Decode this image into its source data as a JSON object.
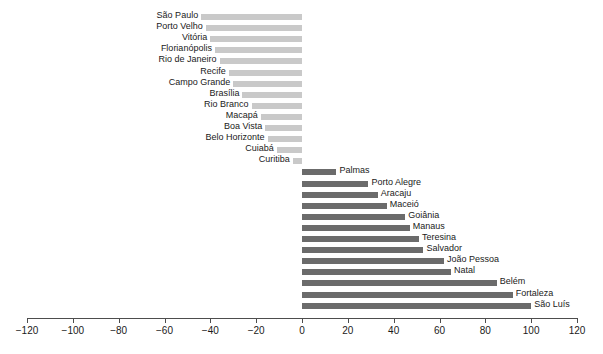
{
  "chart_data": {
    "type": "bar",
    "orientation": "horizontal",
    "title": "",
    "subtitle": "",
    "xlabel": "",
    "ylabel": "",
    "xlim": [
      -120,
      120
    ],
    "xticks": [
      -120,
      -100,
      -80,
      -60,
      -40,
      -20,
      0,
      20,
      40,
      60,
      80,
      100,
      120
    ],
    "xticklabels": [
      "−120",
      "−100",
      "−80",
      "−60",
      "−40",
      "−20",
      "0",
      "20",
      "40",
      "60",
      "80",
      "100",
      "120"
    ],
    "grid": false,
    "legend": null,
    "colors": {
      "negative": "#c9c9c9",
      "positive": "#6b6b6b",
      "axis": "#4d4d4d",
      "text": "#1a1a1a",
      "background": "#ffffff"
    },
    "categories": [
      "São Paulo",
      "Porto Velho",
      "Vitória",
      "Florianópolis",
      "Rio de Janeiro",
      "Recife",
      "Campo Grande",
      "Brasília",
      "Rio Branco",
      "Macapá",
      "Boa Vista",
      "Belo Horizonte",
      "Cuiabá",
      "Curitiba",
      "Palmas",
      "Porto Alegre",
      "Aracaju",
      "Maceió",
      "Goiânia",
      "Manaus",
      "Teresina",
      "Salvador",
      "João Pessoa",
      "Natal",
      "Belém",
      "Fortaleza",
      "São Luís"
    ],
    "values": [
      -44,
      -42,
      -40,
      -38,
      -36,
      -32,
      -30,
      -26,
      -22,
      -18,
      -16,
      -15,
      -11,
      -4,
      15,
      29,
      33,
      37,
      45,
      47,
      51,
      53,
      62,
      65,
      85,
      92,
      100
    ],
    "bars": [
      {
        "label": "São Paulo",
        "value": -44
      },
      {
        "label": "Porto Velho",
        "value": -42
      },
      {
        "label": "Vitória",
        "value": -40
      },
      {
        "label": "Florianópolis",
        "value": -38
      },
      {
        "label": "Rio de Janeiro",
        "value": -36
      },
      {
        "label": "Recife",
        "value": -32
      },
      {
        "label": "Campo Grande",
        "value": -30
      },
      {
        "label": "Brasília",
        "value": -26
      },
      {
        "label": "Rio Branco",
        "value": -22
      },
      {
        "label": "Macapá",
        "value": -18
      },
      {
        "label": "Boa Vista",
        "value": -16
      },
      {
        "label": "Belo Horizonte",
        "value": -15
      },
      {
        "label": "Cuiabá",
        "value": -11
      },
      {
        "label": "Curitiba",
        "value": -4
      },
      {
        "label": "Palmas",
        "value": 15
      },
      {
        "label": "Porto Alegre",
        "value": 29
      },
      {
        "label": "Aracaju",
        "value": 33
      },
      {
        "label": "Maceió",
        "value": 37
      },
      {
        "label": "Goiânia",
        "value": 45
      },
      {
        "label": "Manaus",
        "value": 47
      },
      {
        "label": "Teresina",
        "value": 51
      },
      {
        "label": "Salvador",
        "value": 53
      },
      {
        "label": "João Pessoa",
        "value": 62
      },
      {
        "label": "Natal",
        "value": 65
      },
      {
        "label": "Belém",
        "value": 85
      },
      {
        "label": "Fortaleza",
        "value": 92
      },
      {
        "label": "São Luís",
        "value": 100
      }
    ]
  }
}
